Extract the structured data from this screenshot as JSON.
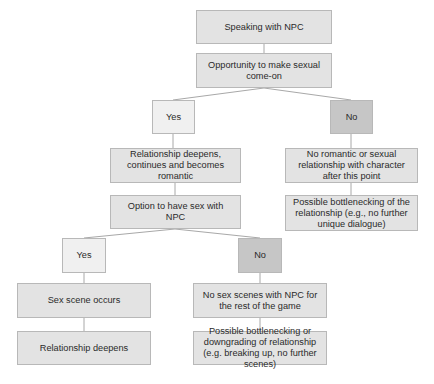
{
  "diagram": {
    "type": "flowchart",
    "colors": {
      "box": "#e3e3e3",
      "yes_box": "#f0f0f0",
      "no_box": "#c6c6c6",
      "border": "#b8b8b8",
      "line": "#a8a8a8"
    },
    "nodes": {
      "speaking": "Speaking with NPC",
      "opportunity": "Opportunity to make sexual come-on",
      "yes1": "Yes",
      "no1": "No",
      "romantic": "Relationship deepens, continues and becomes romantic",
      "no_romance": "No romantic or sexual relationship with character after this point",
      "option_sex": "Option to have sex with NPC",
      "bottleneck1": "Possible bottlenecking of the relationship (e.g., no further unique dialogue)",
      "yes2": "Yes",
      "no2": "No",
      "sex_scene": "Sex scene occurs",
      "no_sex": "No sex scenes with NPC for the rest of the game",
      "deepens": "Relationship deepens",
      "bottleneck2": "Possible bottlenecking or downgrading of relationship (e.g. breaking up, no further scenes)"
    },
    "edges": [
      [
        "speaking",
        "opportunity"
      ],
      [
        "opportunity",
        "yes1"
      ],
      [
        "opportunity",
        "no1"
      ],
      [
        "yes1",
        "romantic"
      ],
      [
        "no1",
        "no_romance"
      ],
      [
        "romantic",
        "option_sex"
      ],
      [
        "no_romance",
        "bottleneck1"
      ],
      [
        "option_sex",
        "yes2"
      ],
      [
        "option_sex",
        "no2"
      ],
      [
        "yes2",
        "sex_scene"
      ],
      [
        "no2",
        "no_sex"
      ],
      [
        "sex_scene",
        "deepens"
      ],
      [
        "no_sex",
        "bottleneck2"
      ]
    ]
  }
}
